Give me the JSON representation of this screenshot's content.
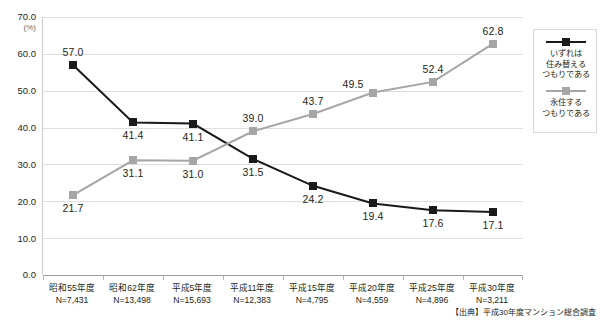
{
  "chart_data": {
    "type": "line",
    "title": "",
    "xlabel": "",
    "ylabel": "",
    "yunit": "(%)",
    "ylim": [
      0,
      70
    ],
    "ytick_step": 10,
    "ytick_labels": [
      "70.0",
      "60.0",
      "50.0",
      "40.0",
      "30.0",
      "20.0",
      "10.0",
      "0.0"
    ],
    "ytick_values": [
      70,
      60,
      50,
      40,
      30,
      20,
      10,
      0
    ],
    "grid": true,
    "legend_position": "right",
    "categories": [
      "昭和55年度",
      "昭和62年度",
      "平成5年度",
      "平成11年度",
      "平成15年度",
      "平成20年度",
      "平成25年度",
      "平成30年度"
    ],
    "category_sample_sizes": [
      "N=7,431",
      "N=13,498",
      "N=15,693",
      "N=12,383",
      "N=4,795",
      "N=4,559",
      "N=4,896",
      "N=3,211"
    ],
    "series": [
      {
        "name": "いずれは\n住み替える\nつもりである",
        "name_lines": [
          "いずれは",
          "住み替える",
          "つもりである"
        ],
        "color": "#1a1a1a",
        "marker": "square",
        "values": [
          57.0,
          41.4,
          41.1,
          31.5,
          24.2,
          19.4,
          17.6,
          17.1
        ],
        "labels": [
          "57.0",
          "41.4",
          "41.1",
          "31.5",
          "24.2",
          "19.4",
          "17.6",
          "17.1"
        ],
        "label_positions": [
          "above",
          "below",
          "below",
          "below",
          "below",
          "below",
          "below",
          "below"
        ]
      },
      {
        "name": "永住する\nつもりである",
        "name_lines": [
          "永住する",
          "つもりである"
        ],
        "color": "#a6a6a6",
        "marker": "square",
        "values": [
          21.7,
          31.1,
          31.0,
          39.0,
          43.7,
          49.5,
          52.4,
          62.8
        ],
        "labels": [
          "21.7",
          "31.1",
          "31.0",
          "39.0",
          "43.7",
          "49.5",
          "52.4",
          "62.8"
        ],
        "label_positions": [
          "below",
          "below",
          "below",
          "above",
          "above",
          "left",
          "above",
          "above"
        ]
      }
    ]
  },
  "source": {
    "text": "【出典】平成30年度マンション総合調査"
  }
}
